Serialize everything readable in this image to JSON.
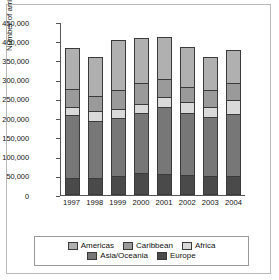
{
  "chart_data": {
    "type": "bar",
    "stacked": true,
    "title": "",
    "xlabel": "",
    "ylabel": "Number of arrivals",
    "ylim": [
      0,
      450000
    ],
    "ytick_interval": 50000,
    "yticks": [
      "450,000",
      "400,000",
      "350,000",
      "300,000",
      "250,000",
      "200,000",
      "150,000",
      "100,000",
      "50,000",
      "0"
    ],
    "grid": false,
    "legend_position": "bottom",
    "categories": [
      "1997",
      "1998",
      "1999",
      "2000",
      "2001",
      "2002",
      "2003",
      "2004"
    ],
    "series": [
      {
        "name": "Europe",
        "color": "#4a4a4a",
        "values": [
          42000,
          43000,
          47000,
          55000,
          52000,
          51000,
          47000,
          48000
        ]
      },
      {
        "name": "Asia/Oceania",
        "color": "#777777",
        "values": [
          166000,
          150000,
          152000,
          158000,
          178000,
          163000,
          155000,
          164000
        ]
      },
      {
        "name": "Africa",
        "color": "#d9d9d9",
        "values": [
          22000,
          26000,
          25000,
          23000,
          25000,
          28000,
          27000,
          36000
        ]
      },
      {
        "name": "Caribbean",
        "color": "#9a9a9a",
        "values": [
          47000,
          40000,
          49000,
          56000,
          47000,
          40000,
          46000,
          45000
        ]
      },
      {
        "name": "Americas",
        "color": "#b0b0b0",
        "values": [
          105000,
          99000,
          129000,
          117000,
          110000,
          104000,
          85000,
          83000
        ]
      }
    ],
    "totals": [
      382000,
      358000,
      402000,
      409000,
      412000,
      386000,
      360000,
      376000
    ]
  },
  "legend": {
    "row1": [
      {
        "label": "Americas",
        "key": "americas"
      },
      {
        "label": "Caribbean",
        "key": "caribbean"
      },
      {
        "label": "Africa",
        "key": "africa"
      }
    ],
    "row2": [
      {
        "label": "Asia/Oceania",
        "key": "asia"
      },
      {
        "label": "Europe",
        "key": "europe"
      }
    ]
  }
}
